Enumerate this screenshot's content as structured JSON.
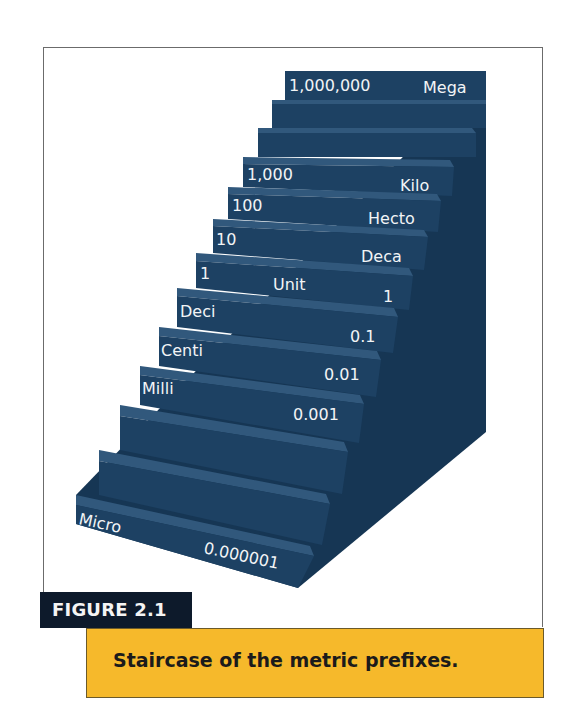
{
  "figure": {
    "label": "FIGURE 2.1",
    "caption": "Staircase of the metric prefixes."
  },
  "colors": {
    "riser": "#1d4163",
    "tread": "#31587c",
    "side": "#163654",
    "text": "#f2f4f6",
    "label_bg": "#0d1a2b",
    "caption_bg": "#f6b92b",
    "frame": "#6b6b6b"
  },
  "steps": [
    {
      "name": "Mega",
      "value": "1,000,000",
      "left_label": "1,000,000",
      "right_label": "Mega"
    },
    {
      "name": "",
      "value": "",
      "left_label": "",
      "right_label": ""
    },
    {
      "name": "",
      "value": "",
      "left_label": "",
      "right_label": ""
    },
    {
      "name": "Kilo",
      "value": "1,000",
      "left_label": "1,000",
      "right_label": "Kilo"
    },
    {
      "name": "Hecto",
      "value": "100",
      "left_label": "100",
      "right_label": "Hecto"
    },
    {
      "name": "Deca",
      "value": "10",
      "left_label": "10",
      "right_label": "Deca"
    },
    {
      "name": "Unit",
      "value": "1",
      "left_label": "1",
      "mid_label": "Unit",
      "right_label": "1"
    },
    {
      "name": "Deci",
      "value": "0.1",
      "left_label": "Deci",
      "right_label": "0.1"
    },
    {
      "name": "Centi",
      "value": "0.01",
      "left_label": "Centi",
      "right_label": "0.01"
    },
    {
      "name": "Milli",
      "value": "0.001",
      "left_label": "Milli",
      "right_label": "0.001"
    },
    {
      "name": "",
      "value": "",
      "left_label": "",
      "right_label": ""
    },
    {
      "name": "",
      "value": "",
      "left_label": "",
      "right_label": ""
    },
    {
      "name": "Micro",
      "value": "0.000001",
      "left_label": "Micro",
      "right_label": "0.000001"
    }
  ]
}
